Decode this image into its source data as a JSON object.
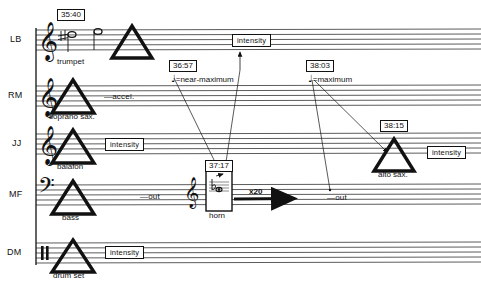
{
  "staves": [
    {
      "id": "LB",
      "performer": "LB",
      "clef": "treble",
      "instrument": "trumpet"
    },
    {
      "id": "RM",
      "performer": "RM",
      "clef": "treble",
      "instrument": "soprano sax."
    },
    {
      "id": "JJ",
      "performer": "JJ",
      "clef": "treble",
      "instrument": "balafon"
    },
    {
      "id": "MF",
      "performer": "MF",
      "clef": "bass",
      "instrument": "bass"
    },
    {
      "id": "DM",
      "performer": "DM",
      "clef": "percussion",
      "instrument": "drum set"
    }
  ],
  "timecodes": [
    {
      "id": "t1",
      "value": "35:40"
    },
    {
      "id": "t2",
      "value": "36:57"
    },
    {
      "id": "t3",
      "value": "37:17"
    },
    {
      "id": "t4",
      "value": "38:03"
    },
    {
      "id": "t5",
      "value": "38:15"
    }
  ],
  "tempo_marks": [
    {
      "id": "tempo1",
      "note": "♩",
      "text": "=near-maximum"
    },
    {
      "id": "tempo2",
      "note": "♩",
      "text": "=maximum"
    }
  ],
  "intensity_boxes": [
    {
      "id": "int_lb",
      "label": "intensity"
    },
    {
      "id": "int_jj",
      "label": "intensity"
    },
    {
      "id": "int_alto",
      "label": "intensity"
    },
    {
      "id": "int_dm",
      "label": "intensity"
    }
  ],
  "directions": [
    {
      "id": "d_accel",
      "text": "—accel."
    },
    {
      "id": "d_out_mf",
      "text": "—out"
    },
    {
      "id": "d_out_right",
      "text": "—out"
    },
    {
      "id": "d_x20",
      "text": "x20"
    }
  ],
  "secondary_instruments": [
    {
      "id": "horn",
      "label": "horn"
    },
    {
      "id": "altosax",
      "label": "alto sax."
    }
  ],
  "colors": {
    "ink": "#111111",
    "staff_line": "#4a4a4a",
    "paper": "#ffffff"
  }
}
